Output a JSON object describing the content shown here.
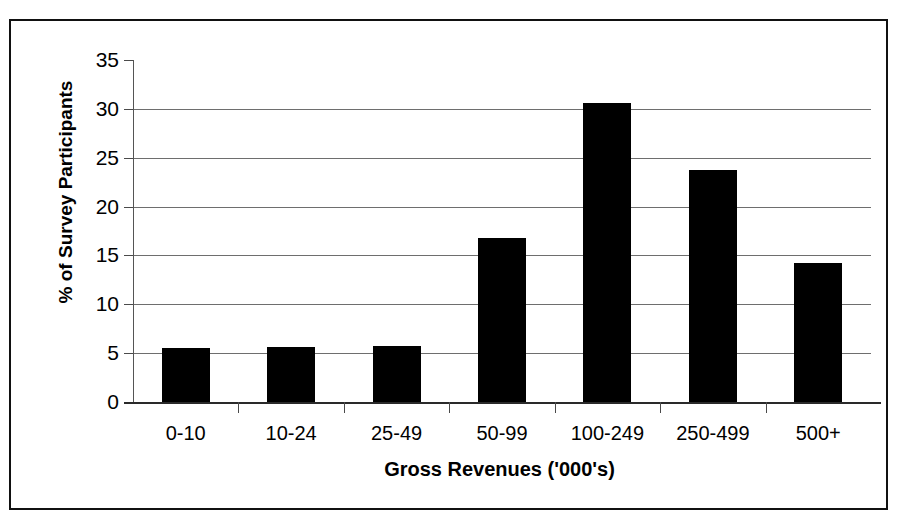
{
  "chart_data": {
    "type": "bar",
    "title": "",
    "xlabel": "Gross Revenues ('000's)",
    "ylabel": "% of Survey Participants",
    "categories": [
      "0-10",
      "10-24",
      "25-49",
      "50-99",
      "100-249",
      "250-499",
      "500+"
    ],
    "values": [
      5.5,
      5.6,
      5.7,
      16.8,
      30.6,
      23.7,
      14.2
    ],
    "ylim": [
      0,
      35
    ],
    "yticks": [
      0,
      5,
      10,
      15,
      20,
      25,
      30,
      35
    ],
    "ytick_labels": [
      "0",
      "5",
      "10",
      "15",
      "20",
      "25",
      "30",
      "35"
    ],
    "grid": "horizontal",
    "legend": "none",
    "bar_color": "#000000",
    "background_color": "#ffffff",
    "axis_color": "#000000",
    "grid_color": "#6e6e6e"
  }
}
